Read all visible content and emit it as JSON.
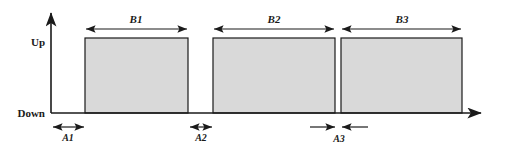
{
  "figure": {
    "background_color": "#ffffff",
    "line_color": "#1a1a1a",
    "bar_fill_color": "#d9d9d9",
    "axes": {
      "y_top_label": "Up",
      "y_bottom_label": "Down",
      "x_axis_name": "time-axis",
      "y_axis_name": "state-axis"
    },
    "pulses": [
      {
        "id": "B1",
        "label": "B1",
        "x": 85,
        "width": 103
      },
      {
        "id": "B2",
        "label": "B2",
        "x": 213,
        "width": 122
      },
      {
        "id": "B3",
        "label": "B3",
        "x": 341,
        "width": 121
      }
    ],
    "gaps": [
      {
        "id": "A1",
        "label": "A1",
        "x": 51,
        "width": 34,
        "arrow_style": "double-inside"
      },
      {
        "id": "A2",
        "label": "A2",
        "x": 188,
        "width": 25,
        "arrow_style": "double-inside"
      },
      {
        "id": "A3",
        "label": "A3",
        "x": 335,
        "width": 6,
        "arrow_style": "double-outside"
      }
    ],
    "geometry": {
      "baseline_y": 113,
      "pulse_top_y": 38,
      "y_axis_x": 51,
      "y_axis_top_y": 9,
      "x_axis_end_x": 487,
      "span_arrow_y": 24,
      "span_label_y": 20,
      "gap_arrow_y": 126,
      "gap_label_y": 140
    }
  }
}
